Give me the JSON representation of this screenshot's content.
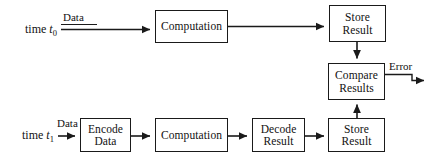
{
  "diagram": {
    "stroke_color": "#1a1a1a",
    "background_color": "#ffffff",
    "nodes": [
      {
        "id": "top-computation",
        "line1": "Computation",
        "line2": ""
      },
      {
        "id": "top-store-result",
        "line1": "Store",
        "line2": "Result"
      },
      {
        "id": "compare-results",
        "line1": "Compare",
        "line2": "Results"
      },
      {
        "id": "encode-data",
        "line1": "Encode",
        "line2": "Data"
      },
      {
        "id": "bottom-computation",
        "line1": "Computation",
        "line2": ""
      },
      {
        "id": "decode-result",
        "line1": "Decode",
        "line2": "Result"
      },
      {
        "id": "bottom-store-result",
        "line1": "Store",
        "line2": "Result"
      }
    ],
    "labels": {
      "time_top_prefix": "time ",
      "time_top_var": "t",
      "time_top_sub": "0",
      "time_bottom_prefix": "time ",
      "time_bottom_var": "t",
      "time_bottom_sub": "1",
      "data_top": "Data",
      "data_bottom": "Data",
      "error": "Error"
    }
  }
}
